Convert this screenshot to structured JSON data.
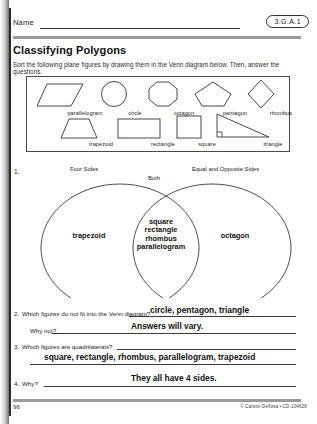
{
  "header": {
    "name_label": "Name",
    "standard_code": "3.G.A.1"
  },
  "title": "Classifying Polygons",
  "instructions": "Sort the following plane figures by drawing them in the Venn diagram below. Then, answer the questions.",
  "figure_bank": {
    "row1": [
      {
        "name": "parallelogram",
        "icon": "parallelogram-shape"
      },
      {
        "name": "circle",
        "icon": "circle-shape"
      },
      {
        "name": "octagon",
        "icon": "octagon-shape"
      },
      {
        "name": "pentagon",
        "icon": "pentagon-shape"
      },
      {
        "name": "rhombus",
        "icon": "rhombus-shape"
      }
    ],
    "row2": [
      {
        "name": "trapezoid",
        "icon": "trapezoid-shape"
      },
      {
        "name": "rectangle",
        "icon": "rectangle-shape"
      },
      {
        "name": "square",
        "icon": "square-shape"
      },
      {
        "name": "triangle",
        "icon": "right-triangle-shape"
      }
    ]
  },
  "venn": {
    "item_number": "1.",
    "left_label": "Four Sides",
    "center_label": "Both",
    "right_label": "Equal and Opposite Sides",
    "left_contents": "trapezoid",
    "center_contents": [
      "square",
      "rectangle",
      "rhombus",
      "parallelogram"
    ],
    "right_contents": "octagon"
  },
  "questions": [
    {
      "number": "2.",
      "prompt": "Which figures do not fit into the Venn diagram?",
      "answer": "circle, pentagon, triangle"
    },
    {
      "number": "",
      "prompt": "Why not?",
      "answer": "Answers will vary."
    },
    {
      "number": "3.",
      "prompt": "Which figures are quadrilaterals?",
      "answer": "square, rectangle, rhombus, parallelogram, trapezoid"
    },
    {
      "number": "4.",
      "prompt": "Why?",
      "answer": "They all have 4 sides."
    }
  ],
  "footer": {
    "page_number": "96",
    "credit": "© Carson-Dellosa • CD-104628"
  },
  "colors": {
    "ink": "#1a1a1a",
    "rule": "#3a3a3a",
    "bar": "#9a9a9a"
  }
}
